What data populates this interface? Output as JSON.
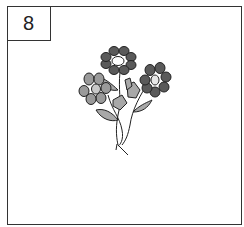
{
  "card": {
    "number": "8",
    "illustration": "bouquet of three flowers with leaves and stems",
    "colors": {
      "dark_petal": "#5a5a5a",
      "light_petal": "#9a9a9a",
      "leaf": "#a8a8a8",
      "outline": "#222222",
      "center_light": "#ffffff",
      "center_grey": "#c8c8c8"
    }
  }
}
